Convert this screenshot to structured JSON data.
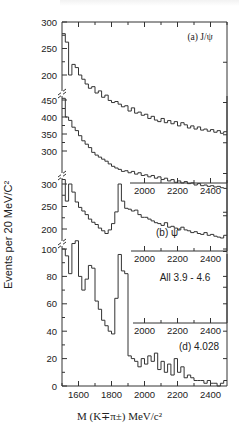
{
  "chart_data": {
    "type": "bar",
    "subtype": "stacked-histogram-panels",
    "title": "",
    "xlabel": "M (K∓π±) MeV/c²",
    "ylabel": "Events per 20 MeV/C²",
    "xlim": [
      1500,
      2500
    ],
    "x_ticks": [
      1600,
      1800,
      2000,
      2200,
      2400
    ],
    "bin_width": 20,
    "panels": [
      {
        "label": "(a) J/ψ",
        "y_ticks": [
          200,
          250,
          300
        ],
        "x": [
          1500,
          1520,
          1540,
          1560,
          1580,
          1600,
          1620,
          1640,
          1660,
          1680,
          1700,
          1720,
          1740,
          1760,
          1780,
          1800,
          1820,
          1840,
          1860,
          1880,
          1900,
          1920,
          1940,
          1960,
          1980,
          2000,
          2020,
          2040,
          2060,
          2080,
          2100,
          2120,
          2140,
          2160,
          2180,
          2200,
          2220,
          2240,
          2260,
          2280,
          2300,
          2320,
          2340,
          2360,
          2380,
          2400,
          2420,
          2440,
          2460,
          2480
        ],
        "values": [
          278,
          262,
          200,
          220,
          214,
          200,
          192,
          183,
          175,
          178,
          166,
          170,
          158,
          162,
          152,
          148,
          150,
          145,
          140,
          142,
          132,
          138,
          128,
          130,
          124,
          126,
          118,
          122,
          115,
          112,
          118,
          110,
          114,
          108,
          112,
          104,
          110,
          106,
          100,
          104,
          98,
          102,
          96,
          98,
          94,
          97,
          92,
          95,
          90,
          93
        ]
      },
      {
        "label": "(b) ψ′",
        "y_ticks": [
          300,
          350,
          400,
          450
        ],
        "x": [
          1500,
          1520,
          1540,
          1560,
          1580,
          1600,
          1620,
          1640,
          1660,
          1680,
          1700,
          1720,
          1740,
          1760,
          1780,
          1800,
          1820,
          1840,
          1860,
          1880,
          1900,
          1920,
          1940,
          1960,
          1980,
          2000,
          2020,
          2040,
          2060,
          2080,
          2100,
          2120,
          2140,
          2160,
          2180,
          2200,
          2220,
          2240,
          2260,
          2280,
          2300,
          2320,
          2340,
          2360,
          2380,
          2400,
          2420,
          2440,
          2460,
          2480
        ],
        "values": [
          455,
          400,
          390,
          370,
          360,
          345,
          330,
          320,
          310,
          296,
          288,
          282,
          276,
          270,
          262,
          255,
          250,
          246,
          240,
          242,
          236,
          240,
          232,
          236,
          228,
          230,
          224,
          228,
          220,
          224,
          216,
          220,
          212,
          216,
          208,
          212,
          206,
          210,
          204,
          206,
          200,
          204,
          198,
          200,
          196,
          198,
          194,
          196,
          192,
          190
        ]
      },
      {
        "label": "All 3.9 - 4.6",
        "y_ticks": [
          200,
          250,
          300
        ],
        "x": [
          1500,
          1520,
          1540,
          1560,
          1580,
          1600,
          1620,
          1640,
          1660,
          1680,
          1700,
          1720,
          1740,
          1760,
          1780,
          1800,
          1820,
          1840,
          1860,
          1880,
          1900,
          1920,
          1940,
          1960,
          1980,
          2000,
          2020,
          2040,
          2060,
          2080,
          2100,
          2120,
          2140,
          2160,
          2180,
          2200,
          2220,
          2240,
          2260,
          2280,
          2300,
          2320,
          2340,
          2360,
          2380,
          2400,
          2420,
          2440,
          2460,
          2480
        ],
        "values": [
          310,
          262,
          300,
          282,
          260,
          248,
          240,
          232,
          222,
          215,
          210,
          202,
          196,
          190,
          198,
          212,
          238,
          300,
          262,
          246,
          244,
          240,
          242,
          232,
          226,
          226,
          222,
          218,
          214,
          212,
          208,
          214,
          204,
          206,
          202,
          198,
          204,
          198,
          196,
          192,
          194,
          190,
          188,
          192,
          186,
          188,
          184,
          182,
          180,
          186
        ]
      },
      {
        "label": "(d) 4.028",
        "y_ticks": [
          0,
          20,
          40,
          60,
          80,
          100
        ],
        "x": [
          1500,
          1520,
          1540,
          1560,
          1580,
          1600,
          1620,
          1640,
          1660,
          1680,
          1700,
          1720,
          1740,
          1760,
          1780,
          1800,
          1820,
          1840,
          1860,
          1880,
          1900,
          1920,
          1940,
          1960,
          1980,
          2000,
          2020,
          2040,
          2060,
          2080,
          2100,
          2120,
          2140,
          2160,
          2180,
          2200,
          2220,
          2240,
          2260,
          2280,
          2300,
          2320,
          2340,
          2360,
          2380,
          2400,
          2420,
          2440,
          2460,
          2480
        ],
        "values": [
          100,
          95,
          82,
          104,
          106,
          80,
          70,
          78,
          88,
          86,
          62,
          56,
          48,
          44,
          40,
          38,
          64,
          96,
          84,
          82,
          22,
          20,
          18,
          14,
          20,
          16,
          22,
          18,
          24,
          12,
          18,
          10,
          16,
          8,
          20,
          10,
          14,
          6,
          8,
          6,
          4,
          4,
          4,
          2,
          4,
          2,
          2,
          0,
          2,
          4
        ]
      }
    ],
    "grid": false,
    "legend": "none",
    "axis_break_marks": true
  },
  "labels": {
    "ylabel": "Events per 20 MeV/C²",
    "xlabel": "M (K∓π±) MeV/c²"
  }
}
